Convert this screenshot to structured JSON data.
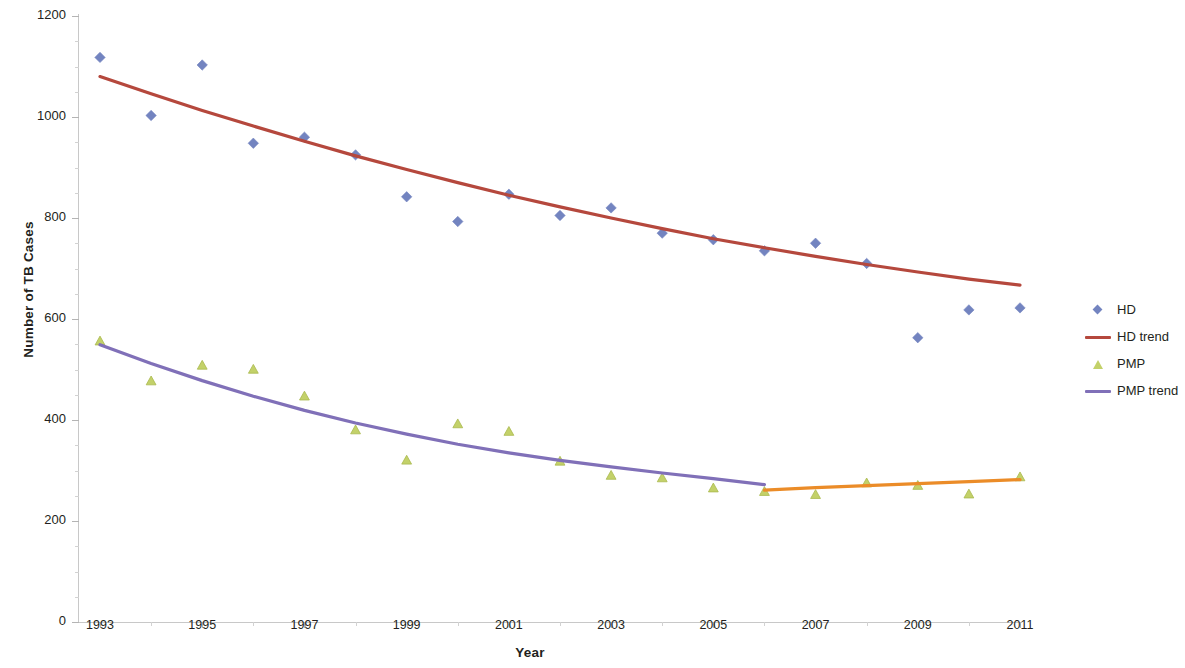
{
  "chart_data": {
    "type": "scatter",
    "title": "",
    "xlabel": "Year",
    "ylabel": "Number of TB Cases",
    "x": [
      1993,
      1994,
      1995,
      1996,
      1997,
      1998,
      1999,
      2000,
      2001,
      2002,
      2003,
      2004,
      2005,
      2006,
      2007,
      2008,
      2009,
      2010,
      2011
    ],
    "xlim": [
      1992.6,
      2011.4
    ],
    "ylim": [
      0,
      1200
    ],
    "y_ticks": [
      0,
      200,
      400,
      600,
      800,
      1000,
      1200
    ],
    "y_tick_labels": [
      "0",
      "200",
      "400",
      "600",
      "800",
      "1000",
      "1200"
    ],
    "x_ticks": [
      1993,
      1995,
      1997,
      1999,
      2001,
      2003,
      2005,
      2007,
      2009,
      2011
    ],
    "x_tick_labels": [
      "1993",
      "1995",
      "1997",
      "1999",
      "2001",
      "2003",
      "2005",
      "2007",
      "2009",
      "2011"
    ],
    "x_minor_ticks": [
      1994,
      1996,
      1998,
      2000,
      2002,
      2004,
      2006,
      2008,
      2010
    ],
    "grid": false,
    "legend_position": "right",
    "series": [
      {
        "name": "HD",
        "kind": "markers",
        "marker": "diamond",
        "color": "#7384c0",
        "values": [
          1118,
          1003,
          1103,
          948,
          960,
          925,
          842,
          793,
          847,
          805,
          820,
          770,
          757,
          735,
          750,
          710,
          563,
          618,
          622
        ]
      },
      {
        "name": "HD trend",
        "kind": "line",
        "color": "#b5483d",
        "x": [
          1993,
          1994,
          1995,
          1996,
          1997,
          1998,
          1999,
          2000,
          2001,
          2002,
          2003,
          2004,
          2005,
          2006,
          2007,
          2008,
          2009,
          2010,
          2011
        ],
        "values": [
          1080,
          1046,
          1013,
          982,
          952,
          923,
          896,
          870,
          845,
          822,
          800,
          779,
          759,
          741,
          724,
          708,
          693,
          679,
          667
        ]
      },
      {
        "name": "PMP",
        "kind": "markers",
        "marker": "triangle",
        "color": "#c3d169",
        "values": [
          556,
          477,
          508,
          500,
          447,
          380,
          320,
          392,
          377,
          318,
          290,
          285,
          265,
          258,
          252,
          275,
          270,
          253,
          287
        ]
      },
      {
        "name": "PMP trend",
        "kind": "line",
        "color": "#8070b8",
        "x": [
          1993,
          1994,
          1995,
          1996,
          1997,
          1998,
          1999,
          2000,
          2001,
          2002,
          2003,
          2004,
          2005,
          2006
        ],
        "values": [
          549,
          512,
          478,
          447,
          419,
          394,
          372,
          352,
          335,
          320,
          307,
          295,
          284,
          272
        ]
      },
      {
        "name": "PMP trend recent",
        "kind": "line",
        "color": "#eb8c28",
        "legend_hidden": true,
        "x": [
          2006,
          2007,
          2008,
          2009,
          2010,
          2011
        ],
        "values": [
          261,
          266,
          270,
          274,
          278,
          282
        ]
      }
    ],
    "legend": [
      {
        "label": "HD",
        "key": "diamond",
        "color": "#7384c0"
      },
      {
        "label": "HD trend",
        "key": "line",
        "color": "#b5483d"
      },
      {
        "label": "PMP",
        "key": "triangle",
        "color": "#c3d169"
      },
      {
        "label": "PMP trend",
        "key": "line",
        "color": "#8070b8"
      }
    ],
    "colors": {
      "hd_marker": "#7384c0",
      "hd_trend": "#b5483d",
      "pmp_marker": "#c3d169",
      "pmp_trend": "#8070b8",
      "pmp_trend_recent": "#eb8c28",
      "axis": "#c8c8c8",
      "text": "#231f20",
      "background": "#ffffff"
    }
  }
}
